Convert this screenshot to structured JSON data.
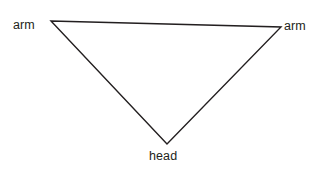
{
  "figure": {
    "type": "labeled-geometric-diagram",
    "background_color": "#ffffff",
    "width": 324,
    "height": 173,
    "shape": {
      "name": "inverted-triangle",
      "stroke_color": "#231f20",
      "stroke_width": 1.4,
      "fill": "none",
      "vertices": [
        {
          "id": "arm-left",
          "x": 51,
          "y": 21
        },
        {
          "id": "arm-right",
          "x": 281,
          "y": 27
        },
        {
          "id": "head",
          "x": 167,
          "y": 144
        }
      ],
      "edges": [
        {
          "from": "arm-left",
          "to": "arm-right"
        },
        {
          "from": "arm-right",
          "to": "head"
        },
        {
          "from": "head",
          "to": "arm-left"
        }
      ]
    },
    "labels": {
      "arm_left": "arm",
      "arm_right": "arm",
      "head": "head"
    }
  }
}
